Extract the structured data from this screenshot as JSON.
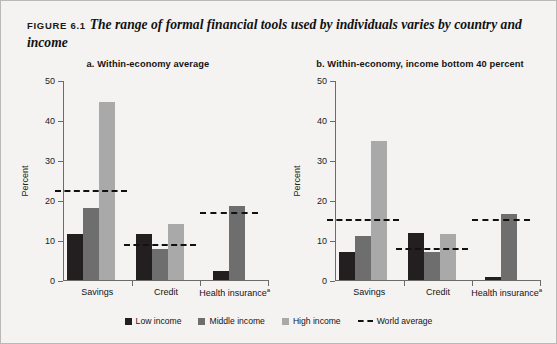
{
  "figure": {
    "label": "FIGURE 6.1",
    "title": "The range of formal financial tools used by individuals varies by country and income"
  },
  "legend": {
    "items": [
      {
        "key": "low",
        "label": "Low income"
      },
      {
        "key": "mid",
        "label": "Middle income"
      },
      {
        "key": "high",
        "label": "High income"
      },
      {
        "key": "avg",
        "label": "World average"
      }
    ]
  },
  "colors": {
    "low_income": "#231f20",
    "middle_income": "#6e6e6e",
    "high_income": "#a9a9a9",
    "world_average": "#111111",
    "background": "#f4f3f1",
    "axis": "#6b6b6b"
  },
  "chart_data": [
    {
      "type": "bar",
      "panel": "a",
      "title": "a.  Within-economy average",
      "categories": [
        "Savings",
        "Credit",
        "Health insurance"
      ],
      "category_footnotes": [
        "",
        "",
        "a"
      ],
      "series": [
        {
          "name": "Low income",
          "values": [
            11.5,
            11.5,
            2.2
          ]
        },
        {
          "name": "Middle income",
          "values": [
            18.0,
            7.8,
            18.5
          ]
        },
        {
          "name": "High income",
          "values": [
            44.5,
            14.0,
            null
          ]
        }
      ],
      "world_average": [
        22.7,
        9.3,
        17.3
      ],
      "xlabel": "",
      "ylabel": "Percent",
      "ylim": [
        0,
        50
      ],
      "yticks": [
        0,
        10,
        20,
        30,
        40,
        50
      ],
      "grid": false,
      "legend_position": "bottom"
    },
    {
      "type": "bar",
      "panel": "b",
      "title": "b.  Within-economy, income bottom 40 percent",
      "categories": [
        "Savings",
        "Credit",
        "Health insurance"
      ],
      "category_footnotes": [
        "",
        "",
        "a"
      ],
      "series": [
        {
          "name": "Low income",
          "values": [
            7.0,
            11.8,
            0.8
          ]
        },
        {
          "name": "Middle income",
          "values": [
            11.0,
            7.0,
            16.5
          ]
        },
        {
          "name": "High income",
          "values": [
            34.7,
            11.5,
            null
          ]
        }
      ],
      "world_average": [
        15.4,
        8.2,
        15.5
      ],
      "xlabel": "",
      "ylabel": "Percent",
      "ylim": [
        0,
        50
      ],
      "yticks": [
        0,
        10,
        20,
        30,
        40,
        50
      ],
      "grid": false,
      "legend_position": "bottom"
    }
  ]
}
